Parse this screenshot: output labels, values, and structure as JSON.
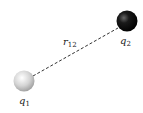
{
  "diagram": {
    "charges": [
      {
        "name": "q1",
        "label": "q",
        "subscript": "1",
        "color": "#d8d8d8",
        "cx": 24,
        "cy": 81,
        "r": 10.5
      },
      {
        "name": "q2",
        "label": "q",
        "subscript": "2",
        "color": "#111111",
        "cx": 127,
        "cy": 21,
        "r": 10.5
      }
    ],
    "distance": {
      "label": "r",
      "subscript": "12",
      "style": "dashed"
    }
  }
}
